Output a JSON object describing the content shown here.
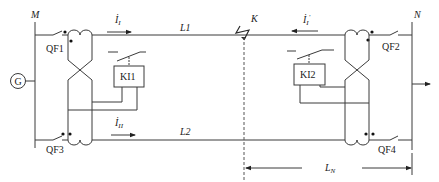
{
  "diagram": {
    "type": "transverse differential protection of parallel lines",
    "buses": [
      {
        "id": "M",
        "label": "M"
      },
      {
        "id": "N",
        "label": "N"
      }
    ],
    "lines": [
      {
        "id": "L1",
        "label": "L1"
      },
      {
        "id": "L2",
        "label": "L2"
      }
    ],
    "breakers": [
      {
        "id": "QF1",
        "label": "QF1"
      },
      {
        "id": "QF2",
        "label": "QF2"
      },
      {
        "id": "QF3",
        "label": "QF3"
      },
      {
        "id": "QF4",
        "label": "QF4"
      }
    ],
    "relays": [
      {
        "id": "KI1",
        "label": "KI1"
      },
      {
        "id": "KI2",
        "label": "KI2"
      }
    ],
    "generator": {
      "label": "G"
    },
    "fault": {
      "label": "K"
    },
    "currents": [
      {
        "id": "I1",
        "base": "İ",
        "sub": "I",
        "sup": "",
        "direction": "right"
      },
      {
        "id": "I1p",
        "base": "İ",
        "sub": "I",
        "sup": "′",
        "direction": "left"
      },
      {
        "id": "I2",
        "base": "İ",
        "sub": "II",
        "sup": "",
        "direction": "right"
      }
    ],
    "dimension": {
      "base": "L",
      "sub": "N"
    }
  }
}
